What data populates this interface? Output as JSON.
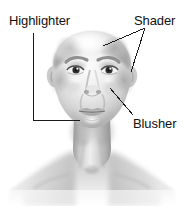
{
  "figure": {
    "type": "annotated-anatomical-illustration",
    "style": "grayscale airbrushed rendering on white background",
    "width": 186,
    "height": 206
  },
  "annotations": [
    {
      "id": "highlighter",
      "label": "Highlighter",
      "label_x": 9,
      "label_y": 14,
      "leader": "elbow",
      "points": "33,33 33,120 80,120",
      "target": "chin and jawline / under-lip area",
      "target_x": 80,
      "target_y": 120
    },
    {
      "id": "shader",
      "label": "Shader",
      "label_x": 134,
      "label_y": 14,
      "leader": "forked",
      "points_a": "145,28 103,46",
      "points_b": "145,28 131,72",
      "target": "temple / brow-bone and outer cheek hollow",
      "target_a_x": 103,
      "target_a_y": 46,
      "target_b_x": 131,
      "target_b_y": 72
    },
    {
      "id": "blusher",
      "label": "Blusher",
      "label_x": 133,
      "label_y": 117,
      "leader": "straight",
      "points": "110,88 133,115",
      "target": "cheekbone apple",
      "target_x": 110,
      "target_y": 88
    }
  ],
  "colors": {
    "background": "#ffffff",
    "text": "#111111",
    "leader_line": "#1a1a1a",
    "skin_light": "#f2f2f2",
    "skin_mid": "#c9c9c9",
    "skin_shadow": "#9a9a9a",
    "skin_deep_shadow": "#7a7a7a",
    "iris": "#2b2b2b",
    "brow": "#8b8b8b",
    "lip": "#b0b0b0"
  },
  "face_features": {
    "head_top_y": 32,
    "head_center_x": 92,
    "eye_left_x": 76,
    "eye_right_x": 110,
    "eye_y": 70,
    "nose_tip_y": 93,
    "mouth_y": 112,
    "chin_y": 127,
    "ear_left_x": 52,
    "ear_right_x": 132,
    "neck_top_y": 130,
    "shoulder_y": 178
  }
}
